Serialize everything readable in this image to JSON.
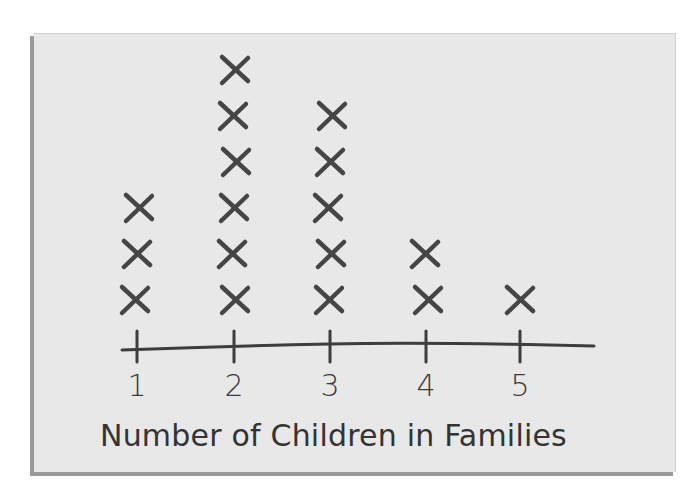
{
  "chart_data": {
    "type": "line-plot (dot plot with X marks)",
    "title": "",
    "xlabel": "Number of Children in Families",
    "ylabel": "",
    "categories": [
      "1",
      "2",
      "3",
      "4",
      "5"
    ],
    "values": [
      3,
      6,
      5,
      2,
      1
    ],
    "marker": "X",
    "grid": false,
    "legend": null
  },
  "colors": {
    "background": "#e8e8e8",
    "ink": "#3d3d3d"
  },
  "axis": {
    "tick_labels": [
      "1",
      "2",
      "3",
      "4",
      "5"
    ],
    "label": "Number of Children in Families"
  }
}
